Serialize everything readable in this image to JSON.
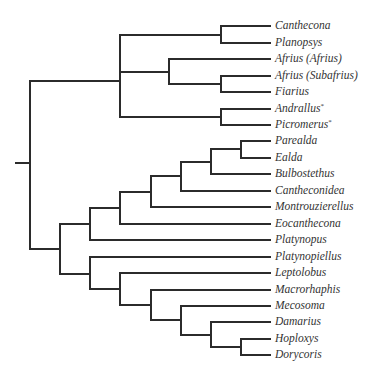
{
  "diagram": {
    "type": "phylogenetic-tree",
    "line_color": "#2b2b2b",
    "label_color": "#333333",
    "label_x": 275,
    "leaf_x": 270,
    "leaves": [
      {
        "name": "Canthecona",
        "marker": "",
        "y": 26
      },
      {
        "name": "Planopsys",
        "marker": "",
        "y": 43
      },
      {
        "name": "Afrius (Afrius)",
        "marker": "",
        "y": 59
      },
      {
        "name": "Afrius (Subafrius)",
        "marker": "",
        "y": 76
      },
      {
        "name": "Fiarius",
        "marker": "",
        "y": 92
      },
      {
        "name": "Andrallus",
        "marker": "*",
        "y": 109
      },
      {
        "name": "Picromerus",
        "marker": "*",
        "y": 125
      },
      {
        "name": "Parealda",
        "marker": "",
        "y": 141
      },
      {
        "name": "Ealda",
        "marker": "",
        "y": 158
      },
      {
        "name": "Bulbostethus",
        "marker": "",
        "y": 174
      },
      {
        "name": "Cantheconidea",
        "marker": "",
        "y": 191
      },
      {
        "name": "Montrouzierellus",
        "marker": "",
        "y": 207
      },
      {
        "name": "Eocanthecona",
        "marker": "",
        "y": 224
      },
      {
        "name": "Platynopus",
        "marker": "",
        "y": 240
      },
      {
        "name": "Platynopiellus",
        "marker": "",
        "y": 257
      },
      {
        "name": "Leptolobus",
        "marker": "",
        "y": 273
      },
      {
        "name": "Macrorhaphis",
        "marker": "",
        "y": 290
      },
      {
        "name": "Mecosoma",
        "marker": "",
        "y": 306
      },
      {
        "name": "Damarius",
        "marker": "",
        "y": 322
      },
      {
        "name": "Hoploxys",
        "marker": "",
        "y": 339
      },
      {
        "name": "Dorycoris",
        "marker": "",
        "y": 355
      }
    ],
    "segments": [
      {
        "id": "root-stub",
        "x1": 16,
        "y1": 163,
        "x2": 30,
        "y2": 163
      },
      {
        "id": "root-vertical",
        "x1": 30,
        "y1": 81,
        "x2": 30,
        "y2": 249
      },
      {
        "id": "clade-a-stem",
        "x1": 30,
        "y1": 81,
        "x2": 120,
        "y2": 81
      },
      {
        "id": "clade-a-vertical",
        "x1": 120,
        "y1": 35,
        "x2": 120,
        "y2": 117
      },
      {
        "id": "a1-stem",
        "x1": 120,
        "y1": 35,
        "x2": 221,
        "y2": 35
      },
      {
        "id": "a1-vertical",
        "x1": 221,
        "y1": 26,
        "x2": 221,
        "y2": 43
      },
      {
        "id": "leaf-canthecona",
        "x1": 221,
        "y1": 26,
        "x2": 270,
        "y2": 26
      },
      {
        "id": "leaf-planopsys",
        "x1": 221,
        "y1": 43,
        "x2": 270,
        "y2": 43
      },
      {
        "id": "a2-stem",
        "x1": 120,
        "y1": 72,
        "x2": 169,
        "y2": 72
      },
      {
        "id": "a2-vertical",
        "x1": 169,
        "y1": 59,
        "x2": 169,
        "y2": 84
      },
      {
        "id": "leaf-afrius-afrius",
        "x1": 169,
        "y1": 59,
        "x2": 270,
        "y2": 59
      },
      {
        "id": "a2b-stem",
        "x1": 169,
        "y1": 84,
        "x2": 221,
        "y2": 84
      },
      {
        "id": "a2b-vertical",
        "x1": 221,
        "y1": 76,
        "x2": 221,
        "y2": 92
      },
      {
        "id": "leaf-afrius-subafrius",
        "x1": 221,
        "y1": 76,
        "x2": 270,
        "y2": 76
      },
      {
        "id": "leaf-fiarius",
        "x1": 221,
        "y1": 92,
        "x2": 270,
        "y2": 92
      },
      {
        "id": "a3-stem",
        "x1": 120,
        "y1": 117,
        "x2": 221,
        "y2": 117
      },
      {
        "id": "a3-vertical",
        "x1": 221,
        "y1": 109,
        "x2": 221,
        "y2": 125
      },
      {
        "id": "leaf-andrallus",
        "x1": 221,
        "y1": 109,
        "x2": 270,
        "y2": 109
      },
      {
        "id": "leaf-picromerus",
        "x1": 221,
        "y1": 125,
        "x2": 270,
        "y2": 125
      },
      {
        "id": "clade-b-stem",
        "x1": 30,
        "y1": 249,
        "x2": 60,
        "y2": 249
      },
      {
        "id": "clade-b-vertical",
        "x1": 60,
        "y1": 224,
        "x2": 60,
        "y2": 274
      },
      {
        "id": "b1-stem",
        "x1": 60,
        "y1": 224,
        "x2": 90,
        "y2": 224
      },
      {
        "id": "b1-vertical",
        "x1": 90,
        "y1": 208,
        "x2": 90,
        "y2": 240
      },
      {
        "id": "leaf-platynopus",
        "x1": 90,
        "y1": 240,
        "x2": 270,
        "y2": 240
      },
      {
        "id": "b1a-stem",
        "x1": 90,
        "y1": 208,
        "x2": 120,
        "y2": 208
      },
      {
        "id": "b1a-vertical",
        "x1": 120,
        "y1": 192,
        "x2": 120,
        "y2": 224
      },
      {
        "id": "leaf-eocanthecona",
        "x1": 120,
        "y1": 224,
        "x2": 270,
        "y2": 224
      },
      {
        "id": "b1b-stem",
        "x1": 120,
        "y1": 192,
        "x2": 151,
        "y2": 192
      },
      {
        "id": "b1b-vertical",
        "x1": 151,
        "y1": 176,
        "x2": 151,
        "y2": 207
      },
      {
        "id": "leaf-montrouzierellus",
        "x1": 151,
        "y1": 207,
        "x2": 270,
        "y2": 207
      },
      {
        "id": "b1c-stem",
        "x1": 151,
        "y1": 176,
        "x2": 181,
        "y2": 176
      },
      {
        "id": "b1c-vertical",
        "x1": 181,
        "y1": 162,
        "x2": 181,
        "y2": 191
      },
      {
        "id": "leaf-cantheconidea",
        "x1": 181,
        "y1": 191,
        "x2": 270,
        "y2": 191
      },
      {
        "id": "b1d-stem",
        "x1": 181,
        "y1": 162,
        "x2": 211,
        "y2": 162
      },
      {
        "id": "b1d-vertical",
        "x1": 211,
        "y1": 149,
        "x2": 211,
        "y2": 174
      },
      {
        "id": "leaf-bulbostethus",
        "x1": 211,
        "y1": 174,
        "x2": 270,
        "y2": 174
      },
      {
        "id": "b1e-stem",
        "x1": 211,
        "y1": 149,
        "x2": 241,
        "y2": 149
      },
      {
        "id": "b1e-vertical",
        "x1": 241,
        "y1": 141,
        "x2": 241,
        "y2": 158
      },
      {
        "id": "leaf-parealda",
        "x1": 241,
        "y1": 141,
        "x2": 270,
        "y2": 141
      },
      {
        "id": "leaf-ealda",
        "x1": 241,
        "y1": 158,
        "x2": 270,
        "y2": 158
      },
      {
        "id": "b2-stem",
        "x1": 60,
        "y1": 274,
        "x2": 90,
        "y2": 274
      },
      {
        "id": "b2-vertical",
        "x1": 90,
        "y1": 257,
        "x2": 90,
        "y2": 289
      },
      {
        "id": "leaf-platynopiellus",
        "x1": 90,
        "y1": 257,
        "x2": 270,
        "y2": 257
      },
      {
        "id": "b2a-stem",
        "x1": 90,
        "y1": 289,
        "x2": 120,
        "y2": 289
      },
      {
        "id": "b2a-vertical",
        "x1": 120,
        "y1": 273,
        "x2": 120,
        "y2": 305
      },
      {
        "id": "leaf-leptolobus",
        "x1": 120,
        "y1": 273,
        "x2": 270,
        "y2": 273
      },
      {
        "id": "b2b-stem",
        "x1": 120,
        "y1": 305,
        "x2": 151,
        "y2": 305
      },
      {
        "id": "b2b-vertical",
        "x1": 151,
        "y1": 290,
        "x2": 151,
        "y2": 320
      },
      {
        "id": "leaf-macrorhaphis",
        "x1": 151,
        "y1": 290,
        "x2": 270,
        "y2": 290
      },
      {
        "id": "b2c-stem",
        "x1": 151,
        "y1": 320,
        "x2": 181,
        "y2": 320
      },
      {
        "id": "b2c-vertical",
        "x1": 181,
        "y1": 306,
        "x2": 181,
        "y2": 335
      },
      {
        "id": "leaf-mecosoma",
        "x1": 181,
        "y1": 306,
        "x2": 270,
        "y2": 306
      },
      {
        "id": "b2d-stem",
        "x1": 181,
        "y1": 335,
        "x2": 211,
        "y2": 335
      },
      {
        "id": "b2d-vertical",
        "x1": 211,
        "y1": 322,
        "x2": 211,
        "y2": 347
      },
      {
        "id": "leaf-damarius",
        "x1": 211,
        "y1": 322,
        "x2": 270,
        "y2": 322
      },
      {
        "id": "b2e-stem",
        "x1": 211,
        "y1": 347,
        "x2": 241,
        "y2": 347
      },
      {
        "id": "b2e-vertical",
        "x1": 241,
        "y1": 339,
        "x2": 241,
        "y2": 355
      },
      {
        "id": "leaf-hoploxys",
        "x1": 241,
        "y1": 339,
        "x2": 270,
        "y2": 339
      },
      {
        "id": "leaf-dorycoris",
        "x1": 241,
        "y1": 355,
        "x2": 270,
        "y2": 355
      }
    ]
  }
}
